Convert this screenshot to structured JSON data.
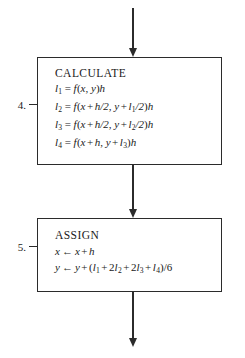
{
  "diagram": {
    "ink_color": "#2b2b2b",
    "background_color": "#ffffff"
  },
  "steps": [
    {
      "number": "4.",
      "box_name": "calculate",
      "heading": "CALCULATE",
      "equations": [
        {
          "lhs_symbol": "l",
          "lhs_sub": "1",
          "operator": "=",
          "rhs_plain": "f(x, y)h",
          "parts": {
            "fn": "f",
            "open": "(",
            "arg1": "x",
            "comma": ", ",
            "arg2": "y",
            "close": ")",
            "trailing": "h"
          }
        },
        {
          "lhs_symbol": "l",
          "lhs_sub": "2",
          "operator": "=",
          "rhs_plain": "f(x + h/2, y + l1/2)h",
          "parts": {
            "fn": "f",
            "open": "(",
            "a_var": "x",
            "a_plus": "+",
            "a_term": "h/2",
            "comma": ", ",
            "b_var": "y",
            "b_plus": "+",
            "b_term_sym": "l",
            "b_term_sub": "1",
            "b_term_tail": "/2",
            "close": ")",
            "trailing": "h"
          }
        },
        {
          "lhs_symbol": "l",
          "lhs_sub": "3",
          "operator": "=",
          "rhs_plain": "f(x + h/2, y + l2/2)h",
          "parts": {
            "fn": "f",
            "open": "(",
            "a_var": "x",
            "a_plus": "+",
            "a_term": "h/2",
            "comma": ", ",
            "b_var": "y",
            "b_plus": "+",
            "b_term_sym": "l",
            "b_term_sub": "2",
            "b_term_tail": "/2",
            "close": ")",
            "trailing": "h"
          }
        },
        {
          "lhs_symbol": "l",
          "lhs_sub": "4",
          "operator": "=",
          "rhs_plain": "f(x + h, y + l3)h",
          "parts": {
            "fn": "f",
            "open": "(",
            "a_var": "x",
            "a_plus": "+",
            "a_term": "h",
            "comma": ", ",
            "b_var": "y",
            "b_plus": "+",
            "b_term_sym": "l",
            "b_term_sub": "3",
            "b_term_tail": "",
            "close": ")",
            "trailing": "h"
          }
        }
      ]
    },
    {
      "number": "5.",
      "box_name": "assign",
      "heading": "ASSIGN",
      "assignments": [
        {
          "lhs": "x",
          "arrow": "←",
          "rhs_plain": "x + h",
          "parts": {
            "var": "x",
            "plus": "+",
            "term": "h"
          }
        },
        {
          "lhs": "y",
          "arrow": "←",
          "rhs_plain": "y + (l1 + 2l2 + 2l3 + l4)/6",
          "parts": {
            "var": "y",
            "plus": "+",
            "open": "(",
            "t1_coef": "",
            "t1_sym": "l",
            "t1_sub": "1",
            "op1": "+",
            "t2_coef": "2",
            "t2_sym": "l",
            "t2_sub": "2",
            "op2": "+",
            "t3_coef": "2",
            "t3_sym": "l",
            "t3_sub": "3",
            "op3": "+",
            "t4_coef": "",
            "t4_sym": "l",
            "t4_sub": "4",
            "close": ")",
            "divisor": "/6"
          }
        }
      ]
    }
  ],
  "connectors": [
    {
      "name": "arrow-top",
      "from": "above",
      "to": "calculate-box",
      "direction": "down"
    },
    {
      "name": "arrow-middle",
      "from": "calculate-box",
      "to": "assign-box",
      "direction": "down"
    },
    {
      "name": "arrow-bottom",
      "from": "assign-box",
      "to": "below",
      "direction": "down"
    }
  ]
}
